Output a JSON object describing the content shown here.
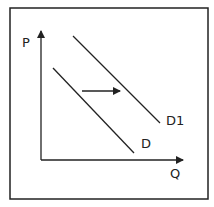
{
  "diagram": {
    "title": "",
    "type": "supply-demand shift",
    "axes": {
      "y_label": "P",
      "x_label": "Q"
    },
    "curves": [
      {
        "name": "D",
        "label": "D"
      },
      {
        "name": "D1",
        "label": "D1"
      }
    ],
    "shift_arrow": {
      "direction": "right",
      "from": "D",
      "to": "D1"
    },
    "colors": {
      "line": "#222222",
      "frame": "#222222",
      "background": "#ffffff"
    }
  }
}
